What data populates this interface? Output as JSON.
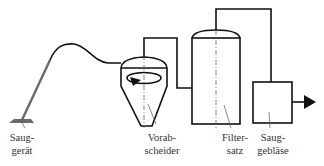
{
  "diagram": {
    "type": "process-schematic",
    "colors": {
      "line": "#111111",
      "wand": "#666666",
      "label": "#333333",
      "background": "#ffffff"
    },
    "components": [
      {
        "id": "sauggeraet",
        "label_line1": "Saug-",
        "label_line2": "gerät"
      },
      {
        "id": "vorabscheider",
        "label_line1": "Vorab-",
        "label_line2": "scheider"
      },
      {
        "id": "filtersatz",
        "label_line1": "Filter-",
        "label_line2": "satz"
      },
      {
        "id": "saugeblaese",
        "label_line1": "Saug-",
        "label_line2": "gebläse"
      }
    ],
    "flow": [
      "sauggeraet",
      "vorabscheider",
      "filtersatz",
      "saugeblaese",
      "outlet"
    ]
  }
}
